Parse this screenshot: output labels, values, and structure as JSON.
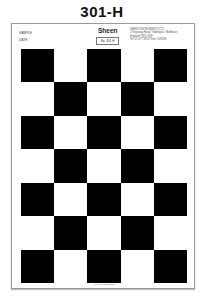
{
  "code": "301-H",
  "card": {
    "brand": "Sheen",
    "sample_label": "SAMPLE",
    "date_label": "DATE",
    "badge": "No. 301-H",
    "address": [
      "SHEEN INSTRUMENTS LTD",
      "2 Kingsway Road, Teddington, Middlesex",
      "England TW11 8QE",
      "Tel: 01-977 3922  Telex: 928188"
    ],
    "footer": "Printed in England"
  },
  "grid": {
    "columns": 5,
    "rows": 7,
    "first_cell": "black",
    "colors": {
      "dark": "#000000",
      "light": "#ffffff"
    }
  }
}
